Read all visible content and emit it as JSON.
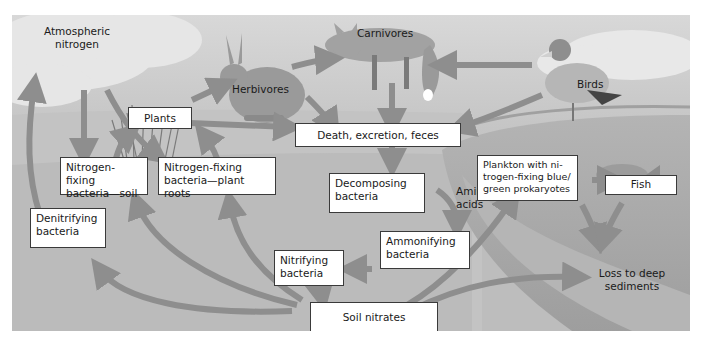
{
  "diagram": {
    "type": "nitrogen-cycle",
    "labels": {
      "atmospheric_nitrogen": "Atmospheric\nnitrogen",
      "plants": "Plants",
      "herbivores": "Herbivores",
      "carnivores": "Carnivores",
      "birds": "Birds",
      "death_excretion_feces": "Death, excretion, feces",
      "n_fixing_soil": "Nitrogen-fixing\nbacteria—soil",
      "n_fixing_roots": "Nitrogen-fixing\nbacteria—plant roots",
      "decomposing_bacteria": "Decomposing\nbacteria",
      "amino_acids": "Amino\nacids",
      "ammonifying_bacteria": "Ammonifying\nbacteria",
      "nitrifying_bacteria": "Nitrifying\nbacteria",
      "denitrifying_bacteria": "Denitrifying\nbacteria",
      "soil_nitrates": "Soil nitrates",
      "plankton": "Plankton with ni-\ntrogen-fixing blue/\ngreen prokaryotes",
      "fish": "Fish",
      "loss_deep_sediments": "Loss to deep\nsediments"
    },
    "flows": [
      {
        "from": "Atmospheric nitrogen",
        "to": "Nitrogen-fixing bacteria—soil"
      },
      {
        "from": "Atmospheric nitrogen",
        "to": "Plants"
      },
      {
        "from": "Nitrogen-fixing bacteria—soil",
        "to": "Plants"
      },
      {
        "from": "Nitrogen-fixing bacteria—plant roots",
        "to": "Plants"
      },
      {
        "from": "Plants",
        "to": "Herbivores"
      },
      {
        "from": "Plants",
        "to": "Death, excretion, feces"
      },
      {
        "from": "Herbivores",
        "to": "Carnivores"
      },
      {
        "from": "Herbivores",
        "to": "Death, excretion, feces"
      },
      {
        "from": "Birds",
        "to": "Carnivores"
      },
      {
        "from": "Birds",
        "to": "Death, excretion, feces"
      },
      {
        "from": "Carnivores",
        "to": "Death, excretion, feces"
      },
      {
        "from": "Death, excretion, feces",
        "to": "Decomposing bacteria"
      },
      {
        "from": "Decomposing bacteria",
        "to": "Ammonifying bacteria",
        "label": "Amino acids"
      },
      {
        "from": "Ammonifying bacteria",
        "to": "Nitrifying bacteria"
      },
      {
        "from": "Nitrifying bacteria",
        "to": "Soil nitrates"
      },
      {
        "from": "Soil nitrates",
        "to": "Denitrifying bacteria"
      },
      {
        "from": "Soil nitrates",
        "to": "Nitrogen-fixing bacteria—soil"
      },
      {
        "from": "Soil nitrates",
        "to": "Nitrogen-fixing bacteria—plant roots"
      },
      {
        "from": "Soil nitrates",
        "to": "Plankton with nitrogen-fixing blue/green prokaryotes"
      },
      {
        "from": "Soil nitrates",
        "to": "Loss to deep sediments"
      },
      {
        "from": "Denitrifying bacteria",
        "to": "Atmospheric nitrogen"
      },
      {
        "from": "Plankton with nitrogen-fixing blue/green prokaryotes",
        "to": "Fish"
      },
      {
        "from": "Plankton with nitrogen-fixing blue/green prokaryotes",
        "to": "Loss to deep sediments"
      },
      {
        "from": "Fish",
        "to": "Loss to deep sediments"
      }
    ],
    "colors": {
      "frame_bg": "#bdbdbd",
      "sky": "#cfcfcf",
      "cloud": "#e6e6e6",
      "land": "#c6c6c6",
      "water": "#a9a9a9",
      "arrow": "#8e8e8e",
      "box_bg": "#ffffff",
      "box_border": "#3a3a3a"
    }
  }
}
